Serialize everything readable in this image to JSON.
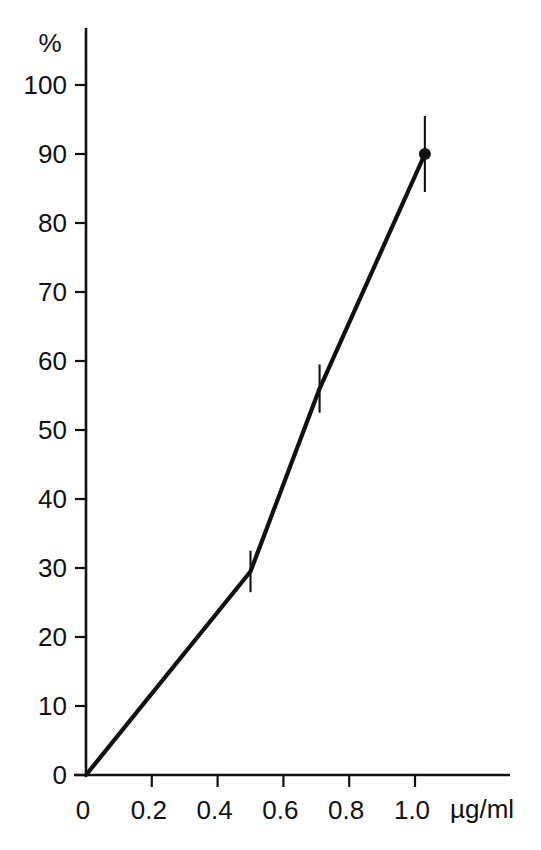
{
  "chart_data": {
    "type": "line",
    "title": "",
    "subtitle": "",
    "xlabel": "µg/ml",
    "ylabel": "%",
    "xlim": [
      0,
      1.1
    ],
    "ylim": [
      0,
      100
    ],
    "grid": false,
    "legend": "none",
    "x_ticks": [
      0,
      0.2,
      0.4,
      0.6,
      0.8,
      1.0
    ],
    "x_tick_labels": [
      "0",
      "0.2",
      "0.4",
      "0.6",
      "0.8",
      "1.0"
    ],
    "y_ticks": [
      0,
      10,
      20,
      30,
      40,
      50,
      60,
      70,
      80,
      90,
      100
    ],
    "y_tick_labels": [
      "0",
      "10",
      "20",
      "30",
      "40",
      "50",
      "60",
      "70",
      "80",
      "90",
      "100"
    ],
    "series": [
      {
        "name": "response",
        "line_color": "#111111",
        "x": [
          0,
          0.5,
          0.71,
          1.03
        ],
        "values": [
          0,
          29.5,
          56,
          90
        ],
        "error": [
          0,
          3,
          3.5,
          5.5
        ],
        "markers": [
          false,
          false,
          false,
          true
        ]
      }
    ]
  },
  "axis": {
    "y_title": "%",
    "x_title": "µg/ml",
    "origin_label": "0"
  },
  "colors": {
    "ink": "#111111",
    "background": "#ffffff"
  }
}
